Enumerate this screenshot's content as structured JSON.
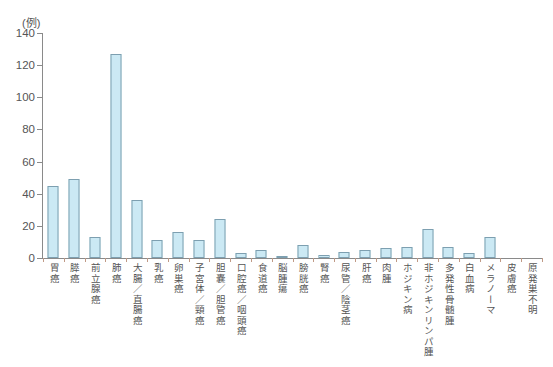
{
  "chart_data": {
    "type": "bar",
    "title": "",
    "subtitle": "",
    "xlabel": "",
    "ylabel": "",
    "unit_label": "(例)",
    "ylim": [
      0,
      140
    ],
    "ytick_step": 20,
    "yticks": [
      0,
      20,
      40,
      60,
      80,
      100,
      120,
      140
    ],
    "ytick_labels": [
      "0",
      "20",
      "40",
      "60",
      "80",
      "100",
      "120",
      "140"
    ],
    "grid": false,
    "legend": "none",
    "bar_color": "#cbe9f4",
    "bar_border_color": "#7d9fb0",
    "axis_color": "#8a8a8a",
    "tick_color": "#c09a86",
    "text_color": "#555555",
    "categories": [
      "胃癌",
      "膵癌",
      "前立腺癌",
      "肺癌",
      "大腸／直腸癌",
      "乳癌",
      "卵巣癌",
      "子宮体／頸癌",
      "胆嚢／胆管癌",
      "口腔癌／咽頭癌",
      "食道癌",
      "脳腫瘍",
      "膀胱癌",
      "腎癌",
      "尿管／陰茎癌",
      "肝癌",
      "肉腫",
      "ホジキン病",
      "非ホジキンリンパ腫",
      "多発性骨髄腫",
      "白血病",
      "メラノーマ",
      "皮膚癌",
      "原発巣不明"
    ],
    "values": [
      45,
      49,
      13,
      127,
      36,
      11,
      16,
      11,
      24,
      3,
      5,
      1,
      8,
      2,
      4,
      5,
      6,
      7,
      18,
      7,
      3,
      13,
      0,
      0
    ]
  }
}
